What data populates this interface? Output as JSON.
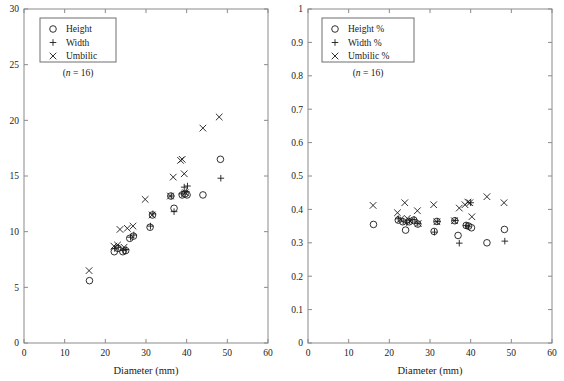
{
  "figure": {
    "panel_count": 2,
    "background": "#ffffff",
    "marker_color": "#1a1a1a",
    "axis_color": "#8a8a8a"
  },
  "chart_data": [
    {
      "type": "scatter",
      "panel": "left",
      "title": "",
      "xlabel": "Diameter (mm)",
      "ylabel": "",
      "xlim": [
        0,
        60
      ],
      "ylim": [
        0,
        30
      ],
      "xticks": [
        0,
        10,
        20,
        30,
        40,
        50,
        60
      ],
      "yticks": [
        0,
        5,
        10,
        15,
        20,
        25,
        30
      ],
      "xticklabels": [
        "0",
        "10",
        "20",
        "30",
        "40",
        "50",
        "60"
      ],
      "yticklabels": [
        "0",
        "5",
        "10",
        "15",
        "20",
        "25",
        "30"
      ],
      "grid": false,
      "legend_position": "upper-left",
      "annotation": "(n = 16)",
      "annotation_n": "16",
      "series": [
        {
          "name": "Height",
          "marker": "circle",
          "points": [
            [
              16.1,
              5.6
            ],
            [
              22.2,
              8.2
            ],
            [
              23.1,
              8.5
            ],
            [
              24.3,
              8.2
            ],
            [
              25.0,
              8.3
            ],
            [
              26.0,
              9.4
            ],
            [
              26.9,
              9.6
            ],
            [
              31.0,
              10.4
            ],
            [
              31.6,
              11.5
            ],
            [
              36.1,
              13.2
            ],
            [
              36.9,
              12.1
            ],
            [
              38.9,
              13.3
            ],
            [
              39.6,
              13.4
            ],
            [
              40.1,
              13.3
            ],
            [
              44.0,
              13.3
            ],
            [
              48.3,
              16.5
            ]
          ]
        },
        {
          "name": "Width",
          "marker": "plus",
          "points": [
            [
              22.3,
              8.5
            ],
            [
              23.2,
              8.6
            ],
            [
              24.4,
              8.3
            ],
            [
              25.1,
              8.4
            ],
            [
              26.2,
              9.5
            ],
            [
              27.0,
              9.7
            ],
            [
              31.1,
              10.5
            ],
            [
              31.7,
              11.6
            ],
            [
              36.2,
              13.2
            ],
            [
              36.9,
              11.8
            ],
            [
              38.8,
              13.4
            ],
            [
              39.4,
              14.0
            ],
            [
              39.9,
              13.6
            ],
            [
              40.2,
              14.1
            ],
            [
              48.4,
              14.8
            ]
          ]
        },
        {
          "name": "Umbilic",
          "marker": "cross",
          "points": [
            [
              16.0,
              6.5
            ],
            [
              22.1,
              8.7
            ],
            [
              23.0,
              8.8
            ],
            [
              23.6,
              10.2
            ],
            [
              24.6,
              8.6
            ],
            [
              25.4,
              10.3
            ],
            [
              26.8,
              10.5
            ],
            [
              29.8,
              12.9
            ],
            [
              31.5,
              11.5
            ],
            [
              36.0,
              13.2
            ],
            [
              36.7,
              14.9
            ],
            [
              38.5,
              16.4
            ],
            [
              38.9,
              16.5
            ],
            [
              39.4,
              15.2
            ],
            [
              39.7,
              13.5
            ],
            [
              44.0,
              19.3
            ],
            [
              48.0,
              20.3
            ]
          ]
        }
      ]
    },
    {
      "type": "scatter",
      "panel": "right",
      "title": "",
      "xlabel": "Diameter (mm)",
      "ylabel": "",
      "xlim": [
        0,
        60
      ],
      "ylim": [
        0,
        1
      ],
      "xticks": [
        0,
        10,
        20,
        30,
        40,
        50,
        60
      ],
      "yticks": [
        0,
        0.1,
        0.2,
        0.3,
        0.4,
        0.5,
        0.6,
        0.7,
        0.8,
        0.9,
        1
      ],
      "xticklabels": [
        "0",
        "10",
        "20",
        "30",
        "40",
        "50",
        "60"
      ],
      "yticklabels": [
        "0",
        "0.1",
        "0.2",
        "0.3",
        "0.4",
        "0.5",
        "0.6",
        "0.7",
        "0.8",
        "0.9",
        "1"
      ],
      "grid": false,
      "legend_position": "upper-left",
      "annotation": "(n = 16)",
      "annotation_n": "16",
      "series": [
        {
          "name": "Height %",
          "marker": "circle",
          "points": [
            [
              16.1,
              0.355
            ],
            [
              22.2,
              0.368
            ],
            [
              23.3,
              0.363
            ],
            [
              24.0,
              0.338
            ],
            [
              24.9,
              0.363
            ],
            [
              26.0,
              0.368
            ],
            [
              27.0,
              0.356
            ],
            [
              31.0,
              0.334
            ],
            [
              31.7,
              0.364
            ],
            [
              36.1,
              0.366
            ],
            [
              36.9,
              0.322
            ],
            [
              38.9,
              0.352
            ],
            [
              39.5,
              0.35
            ],
            [
              40.2,
              0.345
            ],
            [
              44.0,
              0.3
            ],
            [
              48.3,
              0.34
            ]
          ]
        },
        {
          "name": "Width %",
          "marker": "plus",
          "points": [
            [
              22.2,
              0.372
            ],
            [
              23.4,
              0.365
            ],
            [
              24.3,
              0.36
            ],
            [
              25.0,
              0.366
            ],
            [
              26.1,
              0.37
            ],
            [
              27.0,
              0.358
            ],
            [
              31.1,
              0.332
            ],
            [
              31.8,
              0.364
            ],
            [
              36.2,
              0.367
            ],
            [
              37.2,
              0.299
            ],
            [
              38.9,
              0.352
            ],
            [
              39.4,
              0.348
            ],
            [
              40.0,
              0.42
            ],
            [
              48.4,
              0.305
            ]
          ]
        },
        {
          "name": "Umbilic %",
          "marker": "cross",
          "points": [
            [
              16.0,
              0.412
            ],
            [
              22.0,
              0.39
            ],
            [
              22.7,
              0.37
            ],
            [
              23.8,
              0.42
            ],
            [
              24.4,
              0.373
            ],
            [
              25.1,
              0.365
            ],
            [
              26.9,
              0.396
            ],
            [
              27.1,
              0.358
            ],
            [
              30.9,
              0.414
            ],
            [
              31.7,
              0.363
            ],
            [
              36.0,
              0.366
            ],
            [
              37.2,
              0.404
            ],
            [
              38.6,
              0.414
            ],
            [
              39.3,
              0.422
            ],
            [
              39.8,
              0.42
            ],
            [
              40.3,
              0.378
            ],
            [
              44.0,
              0.438
            ],
            [
              48.2,
              0.42
            ]
          ]
        }
      ]
    }
  ]
}
